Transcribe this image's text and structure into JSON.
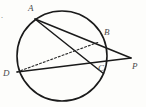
{
  "figure": {
    "kind": "circle-secants-diagram",
    "width": 146,
    "height": 107,
    "background_color": "#fdfdfb",
    "stroke_color": "#1a1a1a",
    "label_color": "#4a4a4a",
    "corner_mark": "."
  },
  "circle": {
    "cx": 62,
    "cy": 56,
    "r": 45,
    "stroke_width": 1.6
  },
  "points": {
    "A": {
      "label": "A",
      "x": 35,
      "y": 19,
      "label_x": 28,
      "label_y": 4
    },
    "B": {
      "label": "B",
      "x": 99,
      "y": 42,
      "label_x": 104,
      "label_y": 28
    },
    "C": {
      "label": "C",
      "x": 94,
      "y": 66,
      "label_x": 98,
      "label_y": 64
    },
    "D": {
      "label": "D",
      "x": 17,
      "y": 72,
      "label_x": 3,
      "label_y": 69
    },
    "P": {
      "label": "P",
      "x": 131,
      "y": 58,
      "label_x": 132,
      "label_y": 62
    }
  },
  "segments": [
    {
      "name": "secant-A-P",
      "from": "A",
      "to": "P",
      "style": "solid",
      "width": 1.5
    },
    {
      "name": "secant-D-P",
      "from": "D",
      "to": "P",
      "style": "solid",
      "width": 1.5
    },
    {
      "name": "chord-A-C",
      "from": "A",
      "to": "C",
      "style": "solid",
      "width": 1.5
    },
    {
      "name": "chord-D-B",
      "from": "D",
      "to": "B",
      "style": "dashed",
      "width": 1.1
    }
  ]
}
